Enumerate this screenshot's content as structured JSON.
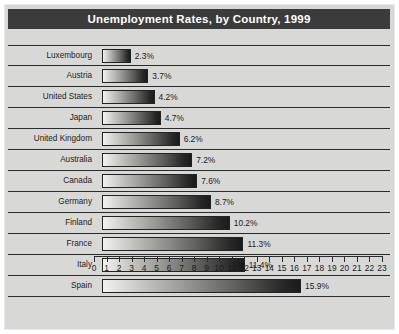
{
  "chart_data": {
    "type": "bar",
    "orientation": "horizontal",
    "title": "Unemployment Rates, by Country, 1999",
    "xlabel": "",
    "ylabel": "",
    "xlim": [
      0,
      23
    ],
    "grid": false,
    "legend": "none",
    "tick_labels": [
      "0",
      "1",
      "2",
      "3",
      "4",
      "5",
      "6",
      "7",
      "8",
      "9",
      "10",
      "11",
      "12",
      "13",
      "14",
      "15",
      "16",
      "17",
      "18",
      "19",
      "20",
      "21",
      "22",
      "23"
    ],
    "categories": [
      "Luxembourg",
      "Austria",
      "United States",
      "Japan",
      "United Kingdom",
      "Australia",
      "Canada",
      "Germany",
      "Finland",
      "France",
      "Italy",
      "Spain"
    ],
    "values": [
      2.3,
      3.7,
      4.2,
      4.7,
      6.2,
      7.2,
      7.6,
      8.7,
      10.2,
      11.3,
      11.4,
      15.9
    ],
    "value_labels": [
      "2.3%",
      "3.7%",
      "4.2%",
      "4.7%",
      "6.2%",
      "7.2%",
      "7.6%",
      "8.7%",
      "10.2%",
      "11.3%",
      "11.4%",
      "15.9%"
    ],
    "colors": {
      "title_band": "#3b3b3b",
      "title_text": "#ffffff",
      "canvas": "#d8d8d6",
      "axis": "#2b2b2b",
      "bar_gradient_start": "#f2f2f0",
      "bar_gradient_end": "#1b1b1b",
      "text": "#1c1c1c"
    }
  }
}
